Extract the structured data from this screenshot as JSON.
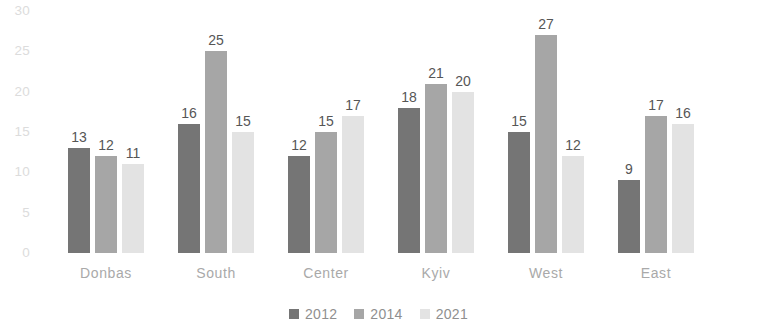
{
  "chart_data": {
    "type": "bar",
    "title": "",
    "subtitle": "",
    "xlabel": "",
    "ylabel": "",
    "ylim": [
      0,
      30
    ],
    "yticks": [
      0,
      5,
      10,
      15,
      20,
      25,
      30
    ],
    "ytick_labels": [
      "0",
      "5",
      "10",
      "15",
      "20",
      "25",
      "30"
    ],
    "grid": false,
    "legend_position": "bottom-center",
    "categories": [
      "Donbas",
      "South",
      "Center",
      "Kyiv",
      "West",
      "East"
    ],
    "series": [
      {
        "name": "2012",
        "color": "#757575",
        "values": [
          13,
          16,
          12,
          18,
          15,
          9
        ],
        "labels": [
          "13",
          "16",
          "12",
          "18",
          "15",
          "9"
        ]
      },
      {
        "name": "2014",
        "color": "#a6a6a6",
        "values": [
          12,
          25,
          15,
          21,
          27,
          17
        ],
        "labels": [
          "12",
          "25",
          "15",
          "21",
          "27",
          "17"
        ]
      },
      {
        "name": "2021",
        "color": "#e3e3e3",
        "values": [
          11,
          15,
          17,
          20,
          12,
          16
        ],
        "labels": [
          "11",
          "15",
          "17",
          "20",
          "12",
          "16"
        ]
      }
    ]
  },
  "axis": {
    "tick_0": "0",
    "tick_5": "5",
    "tick_10": "10",
    "tick_15": "15",
    "tick_20": "20",
    "tick_25": "25",
    "tick_30": "30"
  },
  "categories": {
    "c0": "Donbas",
    "c1": "South",
    "c2": "Center",
    "c3": "Kyiv",
    "c4": "West",
    "c5": "East"
  },
  "legend": {
    "items": [
      {
        "label": "2012",
        "color": "#757575"
      },
      {
        "label": "2014",
        "color": "#a6a6a6"
      },
      {
        "label": "2021",
        "color": "#e3e3e3"
      }
    ]
  },
  "colors": {
    "series_2012": "#757575",
    "series_2014": "#a6a6a6",
    "series_2021": "#e3e3e3",
    "value_label": "#565656",
    "tick_label": "#dcdcdc",
    "category_label": "#a9a9a9",
    "legend_label": "#8f8f8f",
    "background": "#ffffff"
  }
}
